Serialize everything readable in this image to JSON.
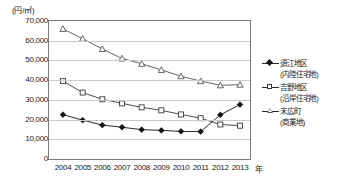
{
  "unit_label": "(円/㎡)",
  "axis": {
    "x_unit_suffix": "年",
    "y_ticks": [
      "70,000",
      "60,000",
      "50,000",
      "40,000",
      "30,000",
      "20,000",
      "10,000",
      "0"
    ],
    "x_ticks": [
      "2004",
      "2005",
      "2006",
      "2007",
      "2008",
      "2009",
      "2010",
      "2011",
      "2012",
      "2013"
    ]
  },
  "legend": {
    "entries": [
      {
        "marker": "filled-diamond",
        "label": "須江地区",
        "sub": "(内陸住宅地)"
      },
      {
        "marker": "open-square",
        "label": "吉野地区",
        "sub": "(沿岸住宅地)"
      },
      {
        "marker": "open-triangle",
        "label": "末広町",
        "sub": "(商業地)"
      }
    ]
  },
  "colors": {
    "series_suegawa": "#111111",
    "series_yoshino": "#3a3a3a",
    "series_suehirocho": "#555555",
    "gridline": "#c9c9c9",
    "frame": "#7a7a7a",
    "background": "#ffffff"
  },
  "chart_data": {
    "type": "line",
    "title": "",
    "xlabel": "年",
    "ylabel": "(円/㎡)",
    "categories": [
      "2004",
      "2005",
      "2006",
      "2007",
      "2008",
      "2009",
      "2010",
      "2011",
      "2012",
      "2013"
    ],
    "ylim": [
      0,
      70000
    ],
    "ytick_interval": 10000,
    "grid": true,
    "legend_position": "right",
    "series": [
      {
        "name": "須江地区（内陸住宅地）",
        "marker": "filled-diamond",
        "values": [
          22500,
          19700,
          17200,
          16100,
          14900,
          14500,
          14000,
          13900,
          22400,
          27600
        ]
      },
      {
        "name": "吉野地区（沿岸住宅地）",
        "marker": "open-square",
        "values": [
          39500,
          33700,
          30300,
          28200,
          26200,
          24700,
          22600,
          20700,
          17500,
          16900
        ]
      },
      {
        "name": "末広町（商業地）",
        "marker": "open-triangle",
        "values": [
          66000,
          61000,
          55800,
          51000,
          48300,
          45200,
          42000,
          39500,
          37400,
          37700
        ]
      }
    ]
  }
}
